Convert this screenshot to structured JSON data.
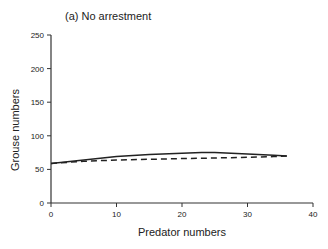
{
  "chart_data": {
    "type": "line",
    "title": "(a) No arrestment",
    "xlabel": "Predator numbers",
    "ylabel": "Grouse numbers",
    "xlim": [
      0,
      40
    ],
    "ylim": [
      0,
      250
    ],
    "xticks": [
      0,
      10,
      20,
      30,
      40
    ],
    "yticks": [
      0,
      50,
      100,
      150,
      200,
      250
    ],
    "grid": false,
    "legend": null,
    "series": [
      {
        "name": "solid",
        "style": "solid",
        "x": [
          0,
          5,
          10,
          15,
          20,
          23,
          25,
          30,
          34,
          36
        ],
        "y": [
          59,
          64,
          69,
          72,
          74,
          75,
          75,
          73,
          71,
          70
        ]
      },
      {
        "name": "dashed",
        "style": "dashed",
        "x": [
          0,
          5,
          10,
          15,
          20,
          25,
          30,
          34,
          36
        ],
        "y": [
          59,
          62,
          64,
          65,
          66,
          67,
          68,
          69,
          70
        ]
      }
    ]
  }
}
